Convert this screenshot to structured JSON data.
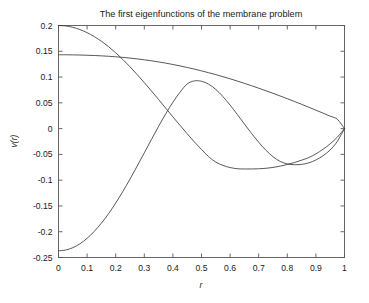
{
  "chart_data": {
    "type": "line",
    "title": "The first eigenfunctions of the membrane problem",
    "xlabel": "r",
    "ylabel": "v(r)",
    "xlim": [
      0,
      1
    ],
    "ylim": [
      -0.25,
      0.2
    ],
    "grid": false,
    "legend": "none",
    "xticks": [
      "0",
      "0.1",
      "0.2",
      "0.3",
      "0.4",
      "0.5",
      "0.6",
      "0.7",
      "0.8",
      "0.9",
      "1"
    ],
    "xtick_values": [
      0,
      0.1,
      0.2,
      0.3,
      0.4,
      0.5,
      0.6,
      0.7,
      0.8,
      0.9,
      1
    ],
    "yticks": [
      "0.2",
      "0.15",
      "0.1",
      "0.05",
      "0",
      "-0.05",
      "-0.1",
      "-0.15",
      "-0.2",
      "-0.25"
    ],
    "ytick_values": [
      0.2,
      0.15,
      0.1,
      0.05,
      0,
      -0.05,
      -0.1,
      -0.15,
      -0.2,
      -0.25
    ],
    "line_color": "#3a3a3a",
    "axis_color": "#585858",
    "background": "#ffffff",
    "x": [
      0,
      0.025,
      0.05,
      0.075,
      0.1,
      0.125,
      0.15,
      0.175,
      0.2,
      0.225,
      0.25,
      0.275,
      0.3,
      0.325,
      0.35,
      0.375,
      0.4,
      0.425,
      0.45,
      0.475,
      0.5,
      0.525,
      0.55,
      0.575,
      0.6,
      0.625,
      0.65,
      0.675,
      0.7,
      0.725,
      0.75,
      0.775,
      0.8,
      0.825,
      0.85,
      0.875,
      0.9,
      0.925,
      0.95,
      0.975,
      1
    ],
    "series": [
      {
        "name": "eigenfunction 1",
        "values": [
          0.1432,
          0.1432,
          0.143,
          0.1427,
          0.1423,
          0.1418,
          0.1411,
          0.1403,
          0.1393,
          0.1381,
          0.1368,
          0.1352,
          0.1335,
          0.1315,
          0.1294,
          0.127,
          0.1244,
          0.1216,
          0.1186,
          0.1154,
          0.112,
          0.1084,
          0.1047,
          0.1007,
          0.0966,
          0.0923,
          0.0878,
          0.0832,
          0.0784,
          0.0735,
          0.0685,
          0.0633,
          0.058,
          0.0526,
          0.0471,
          0.0415,
          0.0358,
          0.03,
          0.0241,
          0.0181,
          0.0
        ]
      },
      {
        "name": "eigenfunction 2",
        "values": [
          0.2,
          0.1991,
          0.1965,
          0.1921,
          0.1861,
          0.1785,
          0.1694,
          0.1589,
          0.147,
          0.134,
          0.1199,
          0.1049,
          0.0892,
          0.073,
          0.0564,
          0.0396,
          0.0228,
          0.0062,
          -0.01,
          -0.0257,
          -0.0405,
          -0.0544,
          -0.065,
          -0.0713,
          -0.0755,
          -0.0778,
          -0.0783,
          -0.0783,
          -0.0779,
          -0.077,
          -0.0753,
          -0.0728,
          -0.0696,
          -0.0658,
          -0.0613,
          -0.0562,
          -0.049,
          -0.04,
          -0.0295,
          -0.0165,
          0.0
        ]
      },
      {
        "name": "eigenfunction 3",
        "values": [
          -0.237,
          -0.2355,
          -0.231,
          -0.2234,
          -0.2128,
          -0.1994,
          -0.1834,
          -0.165,
          -0.1444,
          -0.1219,
          -0.0979,
          -0.0728,
          -0.047,
          -0.0211,
          0.0044,
          0.0288,
          0.0512,
          0.0707,
          0.0866,
          0.0925,
          0.0918,
          0.0862,
          0.076,
          0.0621,
          0.0456,
          0.0275,
          0.0089,
          -0.0093,
          -0.0265,
          -0.0418,
          -0.0545,
          -0.0636,
          -0.0684,
          -0.07,
          -0.0694,
          -0.0664,
          -0.0609,
          -0.0526,
          -0.0414,
          -0.0246,
          0.0
        ]
      }
    ]
  }
}
